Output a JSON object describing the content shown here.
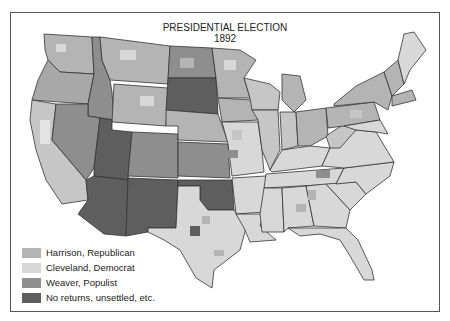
{
  "map": {
    "title": "PRESIDENTIAL ELECTION",
    "year": "1892",
    "colors": {
      "republican": "#b4b4b4",
      "democrat": "#d8d8d8",
      "populist": "#8e8e8e",
      "no_returns": "#5e5e5e",
      "border": "#333333",
      "background": "#ffffff"
    }
  },
  "legend": {
    "items": [
      {
        "label": "Harrison, Republican",
        "color": "#b4b4b4"
      },
      {
        "label": "Cleveland, Democrat",
        "color": "#d8d8d8"
      },
      {
        "label": "Weaver, Populist",
        "color": "#8e8e8e"
      },
      {
        "label": "No returns, unsettled, etc.",
        "color": "#5e5e5e"
      }
    ]
  }
}
